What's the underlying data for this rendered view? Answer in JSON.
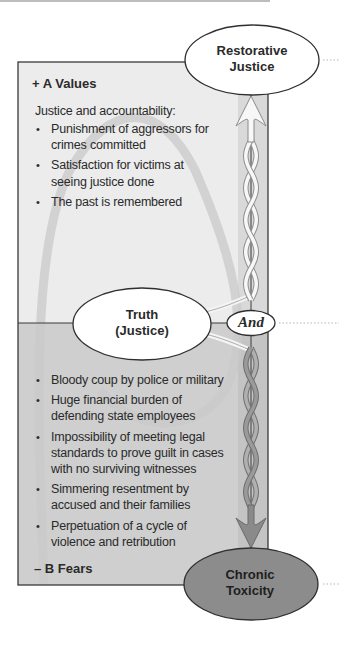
{
  "diagram": {
    "top_node": {
      "line1": "Restorative",
      "line2": "Justice"
    },
    "center_node": {
      "line1": "Truth",
      "line2": "(Justice)"
    },
    "connector": {
      "label": "And"
    },
    "bottom_node": {
      "line1": "Chronic",
      "line2": "Toxicity"
    },
    "upper_panel": {
      "heading": "+ A Values",
      "intro": "Justice and accountability:",
      "items": [
        "Punishment of aggressors for crimes committed",
        "Satisfaction for victims at seeing justice done",
        "The past is remembered"
      ]
    },
    "lower_panel": {
      "heading": "– B Fears",
      "items": [
        "Bloody coup by police or military",
        "Huge financial burden of defending state employees",
        "Impossibility of meeting legal standards to prove guilt in cases with no surviving witnesses",
        "Simmering resentment by accused and their families",
        "Perpetuation of a cycle of violence and retribution"
      ]
    },
    "colors": {
      "upper_fill": "#ececec",
      "lower_fill": "#cfcfcf",
      "strip_upper": "#d9d9d9",
      "strip_lower": "#c4c4c4",
      "arch": "#c8c8c8",
      "bottom_node_fill": "#8c8c8c",
      "arrow_down": "#8a8a8a",
      "outline": "#2f2f2f"
    }
  }
}
